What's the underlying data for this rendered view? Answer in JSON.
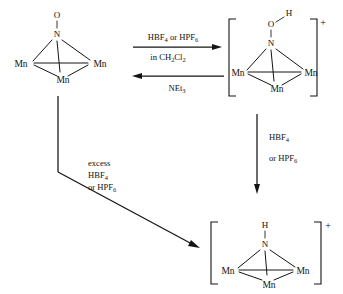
{
  "scheme": {
    "title": "Protonation and deoxygenation of a triangular trimanganese nitrosyl cluster",
    "structures": {
      "reactant": {
        "name": "mu3-nitrosyl trimanganese cluster",
        "apex_top_atom": "O",
        "apex_atom": "N",
        "metal_left": "Mn",
        "metal_right": "Mn",
        "metal_bottom": "Mn",
        "charge": "",
        "bracketed": false
      },
      "hydroxyimido_cation": {
        "name": "mu3-hydroxyimido trimanganese cation",
        "apex_top_atom": "O",
        "hydrogen": "H",
        "apex_atom": "N",
        "metal_left": "Mn",
        "metal_right": "Mn",
        "metal_bottom": "Mn",
        "charge": "+",
        "bracketed": true
      },
      "imido_cation": {
        "name": "mu3-imido trimanganese cation",
        "hydrogen": "H",
        "apex_atom": "N",
        "metal_left": "Mn",
        "metal_right": "Mn",
        "metal_bottom": "Mn",
        "charge": "+",
        "bracketed": true
      }
    },
    "arrows": {
      "forward_top": {
        "direction": "right",
        "label_above_main": "HBF",
        "label_above_sub1": "4",
        "label_above_mid": " or HPF",
        "label_above_sub2": "6",
        "label_below_main": "in CH",
        "label_below_sub1": "2",
        "label_below_mid": "Cl",
        "label_below_sub2": "2"
      },
      "reverse_top": {
        "direction": "left",
        "label_main": "NEt",
        "label_sub": "3"
      },
      "vertical_right": {
        "direction": "down",
        "label_line1_main": "HBF",
        "label_line1_sub": "4",
        "label_line2_main": "or HPF",
        "label_line2_sub": "6"
      },
      "diagonal_left": {
        "direction": "down-right",
        "label_line1": "excess",
        "label_line2_main": "HBF",
        "label_line2_sub": "4",
        "label_line3_main": "or HPF",
        "label_line3_sub": "6"
      }
    },
    "colors": {
      "ink": "#141414",
      "background": "#ffffff"
    }
  }
}
